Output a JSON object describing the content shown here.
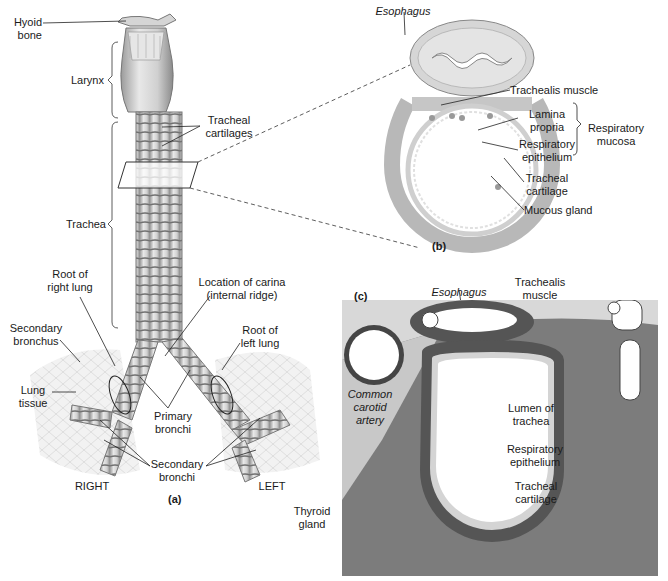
{
  "figure": {
    "panel_a": {
      "tag": "(a)",
      "labels": {
        "hyoid_bone": "Hyoid\nbone",
        "larynx": "Larynx",
        "tracheal_cartilages": "Tracheal\ncartilages",
        "trachea": "Trachea",
        "root_right_lung": "Root of\nright lung",
        "location_carina": "Location of carina\n(internal ridge)",
        "secondary_bronchus": "Secondary\nbronchus",
        "root_left_lung": "Root of\nleft lung",
        "lung_tissue": "Lung\ntissue",
        "primary_bronchi": "Primary\nbronchi",
        "secondary_bronchi": "Secondary\nbronchi",
        "right": "RIGHT",
        "left": "LEFT"
      }
    },
    "panel_b": {
      "tag": "(b)",
      "labels": {
        "esophagus": "Esophagus",
        "trachealis_muscle": "Trachealis muscle",
        "lamina_propria": "Lamina\npropria",
        "respiratory_epithelium": "Respiratory\nepithelium",
        "respiratory_mucosa": "Respiratory\nmucosa",
        "tracheal_cartilage": "Tracheal\ncartilage",
        "mucous_gland": "Mucous gland"
      }
    },
    "panel_c": {
      "tag": "(c)",
      "labels": {
        "esophagus": "Esophagus",
        "trachealis_muscle": "Trachealis\nmuscle",
        "common_carotid_artery": "Common\ncarotid\nartery",
        "lumen_of_trachea": "Lumen of\ntrachea",
        "respiratory_epithelium": "Respiratory\nepithelium",
        "tracheal_cartilage": "Tracheal\ncartilage",
        "thyroid_gland": "Thyroid\ngland"
      }
    }
  },
  "colors": {
    "background": "#ffffff",
    "tissue_light": "#d8d8d8",
    "tissue_mid": "#a8a8a8",
    "tissue_dark": "#5a5a5a",
    "line": "#1a1a1a"
  }
}
